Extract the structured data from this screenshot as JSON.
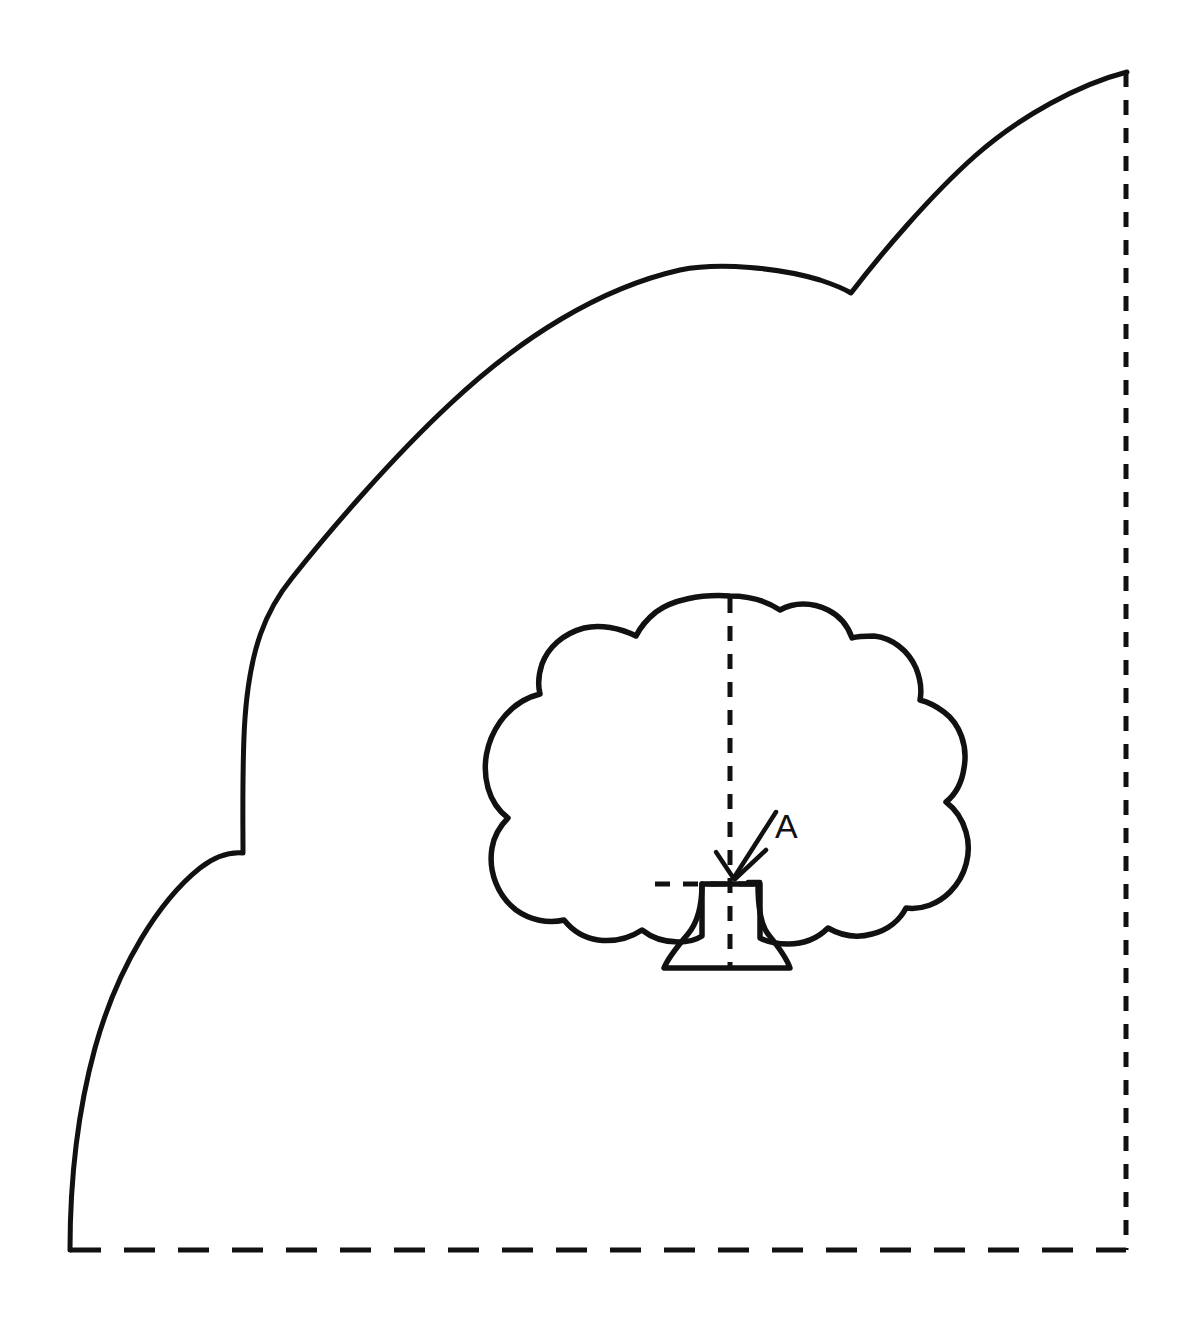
{
  "figure": {
    "background_color": "#ffffff",
    "ink_color": "#111111",
    "canvas": {
      "width": 1183,
      "height": 1322
    }
  },
  "annotations": {
    "point_a_label": "A",
    "point_a_position": {
      "x": 787,
      "y": 826
    },
    "point_a_target": {
      "x": 731,
      "y": 884
    }
  },
  "elements": {
    "hillside_label": "hillside-profile",
    "tree_label": "tree-elevation",
    "baseline_label": "ground-baseline",
    "right_edge_label": "right-boundary",
    "tree_axis_label": "tree-center-axis",
    "tree_base_label": "tree-base-line"
  },
  "geometry": {
    "hillside_path": "M 70,1250 C 70,1180 78,1110 95,1048 C 118,965 160,900 200,868 C 218,854 232,852 243,853 C 243,820 242,760 245,718 C 250,648 266,610 292,578 C 330,530 392,458 450,404 C 520,338 600,288 680,270 C 720,262 780,268 820,280 C 838,286 846,290 851,293 C 880,255 930,196 975,156 C 1020,116 1080,84 1127,72",
    "baseline_path": "M 70,1250 L 1126,1250",
    "right_edge_path": "M 1126,72 L 1126,1250",
    "canopy_path": "M 730,596 C 700,594 672,600 656,612 C 646,620 640,628 636,636 C 620,628 600,624 584,628 C 562,634 548,648 542,664 C 538,676 538,686 540,694 C 524,698 510,708 500,722 C 486,742 482,766 488,788 C 492,802 500,812 508,818 C 500,826 494,836 492,848 C 488,872 498,896 516,910 C 530,920 548,924 564,920 C 572,930 584,938 598,940 C 614,942 630,938 642,930 C 652,938 664,942 678,942 C 688,942 696,940 702,936 L 702,884 L 760,884 L 760,938 C 768,942 778,944 788,944 C 804,944 818,938 828,928 C 842,936 858,938 872,934 C 888,930 900,920 906,908 C 922,910 938,904 950,892 C 966,876 972,852 966,832 C 962,818 954,808 946,802 C 956,794 962,782 964,768 C 968,746 960,724 944,712 C 936,706 928,702 920,700 C 922,690 920,678 916,668 C 908,650 892,638 874,636 C 866,636 858,636 852,638 C 848,626 840,616 828,610 C 812,602 794,602 780,610 C 768,602 750,596 730,596 Z",
    "trunk_path": "M 702,884 C 702,906 698,922 688,934 C 676,948 668,958 664,968 L 790,968 C 786,956 776,944 768,934 C 760,924 758,906 758,884",
    "tree_axis_path": "M 730,598 L 730,968",
    "tree_base_path": "M 655,884 L 764,884",
    "arrow_shaft_path": "M 776,812 L 735,876",
    "arrow_head_left_path": "M 716,852 L 734,879",
    "arrow_head_right_path": "M 766,850 L 735,879",
    "arrow_tick_left_path": "M 706,884 L 716,884",
    "arrow_tick_right_path": "M 748,882 L 760,882"
  }
}
